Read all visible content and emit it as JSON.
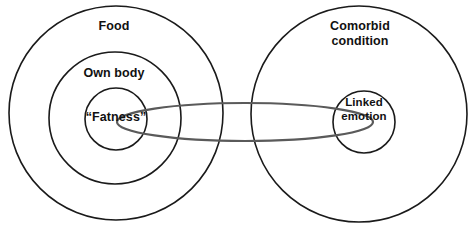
{
  "diagram": {
    "type": "venn-nested-circles",
    "background_color": "#ffffff",
    "outline_color": "#1a1a1a",
    "link_color": "#5a5a5a",
    "text_color": "#111111",
    "left_group": {
      "outer_label": "Food",
      "middle_label": "Own body",
      "inner_label": "“Fatness”"
    },
    "right_group": {
      "outer_label": "Comorbid\ncondition",
      "inner_label": "Linked\nemotion"
    },
    "connector": {
      "name": "linking-ellipse",
      "from": "“Fatness”",
      "to": "Linked emotion"
    }
  }
}
